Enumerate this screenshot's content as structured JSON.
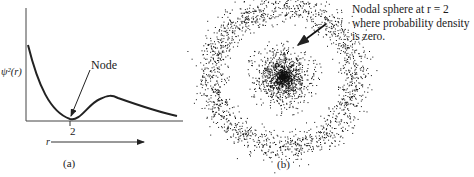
{
  "panel_a": {
    "ylabel": "ψ²(r)",
    "xlabel": "r",
    "tick_label": "2",
    "annotation": "Node",
    "caption": "(a)"
  },
  "panel_b": {
    "caption": "(b)",
    "annotation_line1": "Nodal sphere at r = 2",
    "annotation_line2": "where probability density",
    "annotation_line3": "is zero."
  },
  "chart_data": {
    "type": "line",
    "title": "",
    "xlabel": "r",
    "ylabel": "ψ²(r)",
    "x_ticks": [
      "2"
    ],
    "series": [
      {
        "name": "ψ²(r) radial probability (2s orbital)",
        "x": [
          0.1,
          0.5,
          1.0,
          1.5,
          2.0,
          2.5,
          3.0,
          3.5,
          4.0,
          5.0,
          6.0
        ],
        "y": [
          0.85,
          0.62,
          0.35,
          0.12,
          0.0,
          0.12,
          0.24,
          0.25,
          0.2,
          0.12,
          0.05
        ]
      }
    ],
    "annotations": [
      {
        "text": "Node",
        "x": 2,
        "y": 0
      }
    ],
    "grid": false,
    "legend": "none"
  }
}
